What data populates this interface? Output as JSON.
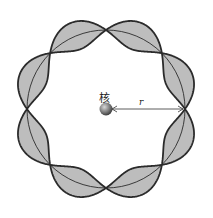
{
  "diagram": {
    "title": "",
    "nucleus_label": "核",
    "radius_label": "r",
    "wave": {
      "wavelengths_on_orbit": 4,
      "node_count": 8,
      "fill_color": "#bdbdbd",
      "stroke_color": "#2b2b2b"
    },
    "orbit": {
      "center": [
        106,
        109
      ],
      "radius": 79
    },
    "nucleus": {
      "color": "#6e6e6e"
    }
  }
}
